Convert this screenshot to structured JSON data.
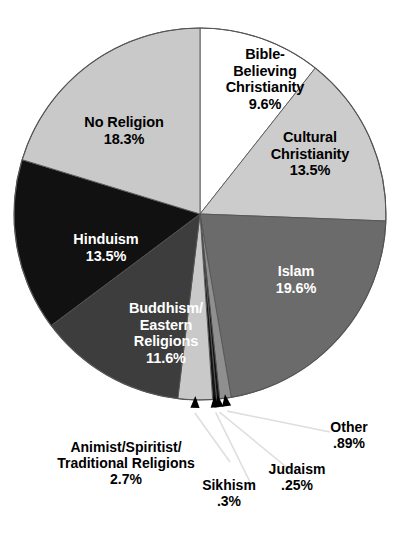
{
  "chart_data": {
    "type": "pie",
    "title": "",
    "subtitle": "",
    "xlabel": "",
    "ylabel": "",
    "legend_position": "none",
    "grid": false,
    "units": "percent",
    "start_angle_deg": 0,
    "direction": "clockwise",
    "categories": [
      "Bible-Believing Christianity",
      "Cultural Christianity",
      "Islam",
      "Other",
      "Judaism",
      "Sikhism",
      "Animist/Spiritist/Traditional Religions",
      "Buddhism/Eastern Religions",
      "Hinduism",
      "No Religion"
    ],
    "values": [
      9.6,
      13.5,
      19.6,
      0.89,
      0.25,
      0.3,
      2.7,
      11.6,
      13.5,
      18.3
    ],
    "value_labels": [
      "9.6%",
      "13.5%",
      "19.6%",
      ".89%",
      ".25%",
      ".3%",
      "2.7%",
      "11.6%",
      "13.5%",
      "18.3%"
    ],
    "colors": [
      "#ffffff",
      "#cccccc",
      "#6b6b6b",
      "#8f8f8f",
      "#141414",
      "#141414",
      "#c9c9c9",
      "#3d3d3d",
      "#111111",
      "#c9c9c9"
    ],
    "slices": [
      {
        "name": "Bible-Believing Christianity",
        "label_lines": [
          "Bible-",
          "Believing",
          "Christianity"
        ],
        "value": 9.6,
        "value_label": "9.6%",
        "color": "#ffffff",
        "text_color": "#000000",
        "label_placement": "inside"
      },
      {
        "name": "Cultural Christianity",
        "label_lines": [
          "Cultural",
          "Christianity"
        ],
        "value": 13.5,
        "value_label": "13.5%",
        "color": "#cccccc",
        "text_color": "#000000",
        "label_placement": "inside"
      },
      {
        "name": "Islam",
        "label_lines": [
          "Islam"
        ],
        "value": 19.6,
        "value_label": "19.6%",
        "color": "#6b6b6b",
        "text_color": "#ffffff",
        "label_placement": "inside"
      },
      {
        "name": "Other",
        "label_lines": [
          "Other"
        ],
        "value": 0.89,
        "value_label": ".89%",
        "color": "#8f8f8f",
        "text_color": "#000000",
        "label_placement": "callout"
      },
      {
        "name": "Judaism",
        "label_lines": [
          "Judaism"
        ],
        "value": 0.25,
        "value_label": ".25%",
        "color": "#141414",
        "text_color": "#000000",
        "label_placement": "callout"
      },
      {
        "name": "Sikhism",
        "label_lines": [
          "Sikhism"
        ],
        "value": 0.3,
        "value_label": ".3%",
        "color": "#141414",
        "text_color": "#000000",
        "label_placement": "callout"
      },
      {
        "name": "Animist/Spiritist/Traditional Religions",
        "label_lines": [
          "Animist/Spiritist/",
          "Traditional Religions"
        ],
        "value": 2.7,
        "value_label": "2.7%",
        "color": "#c9c9c9",
        "text_color": "#000000",
        "label_placement": "callout"
      },
      {
        "name": "Buddhism/Eastern Religions",
        "label_lines": [
          "Buddhism/",
          "Eastern",
          "Religions"
        ],
        "value": 11.6,
        "value_label": "11.6%",
        "color": "#3d3d3d",
        "text_color": "#ffffff",
        "label_placement": "inside"
      },
      {
        "name": "Hinduism",
        "label_lines": [
          "Hinduism"
        ],
        "value": 13.5,
        "value_label": "13.5%",
        "color": "#111111",
        "text_color": "#ffffff",
        "label_placement": "inside"
      },
      {
        "name": "No Religion",
        "label_lines": [
          "No Religion"
        ],
        "value": 18.3,
        "value_label": "18.3%",
        "color": "#c9c9c9",
        "text_color": "#000000",
        "label_placement": "inside"
      }
    ]
  },
  "labels": {
    "bible": {
      "l1": "Bible-",
      "l2": "Believing",
      "l3": "Christianity",
      "pct": "9.6%"
    },
    "cultural": {
      "l1": "Cultural",
      "l2": "Christianity",
      "pct": "13.5%"
    },
    "islam": {
      "l1": "Islam",
      "pct": "19.6%"
    },
    "noreligion": {
      "l1": "No Religion",
      "pct": "18.3%"
    },
    "hinduism": {
      "l1": "Hinduism",
      "pct": "13.5%"
    },
    "buddhism": {
      "l1": "Buddhism/",
      "l2": "Eastern",
      "l3": "Religions",
      "pct": "11.6%"
    },
    "animist": {
      "l1": "Animist/Spiritist/",
      "l2": "Traditional Religions",
      "pct": "2.7%"
    },
    "sikhism": {
      "l1": "Sikhism",
      "pct": ".3%"
    },
    "judaism": {
      "l1": "Judaism",
      "pct": ".25%"
    },
    "other": {
      "l1": "Other",
      "pct": ".89%"
    }
  },
  "style": {
    "background": "#ffffff",
    "outline": "#555555",
    "leader_line": "#dedede"
  }
}
